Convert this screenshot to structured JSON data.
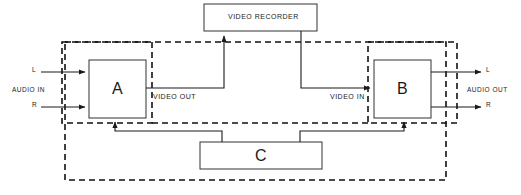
{
  "diagram": {
    "type": "block-diagram",
    "colors": {
      "line": "#1a1a1a",
      "dashed": "#111111",
      "background": "#ffffff",
      "text": "#1a1a1a"
    },
    "blocks": [
      {
        "id": "recorder",
        "label": "VIDEO RECORDER",
        "shape": "rectangle",
        "x": 204,
        "y": 4,
        "w": 113,
        "h": 27
      },
      {
        "id": "a",
        "label": "A",
        "shape": "rectangle",
        "x": 89,
        "y": 60,
        "w": 57,
        "h": 58
      },
      {
        "id": "b",
        "label": "B",
        "shape": "rectangle",
        "x": 374,
        "y": 60,
        "w": 57,
        "h": 58
      },
      {
        "id": "c",
        "label": "C",
        "shape": "rectangle",
        "x": 200,
        "y": 142,
        "w": 122,
        "h": 27
      }
    ],
    "enclosures": [
      {
        "id": "outer-dashed",
        "style": "dashed",
        "x": 65,
        "y": 42,
        "w": 381,
        "h": 138
      },
      {
        "id": "unit-a-dashed",
        "style": "dashed",
        "x": 62,
        "y": 42,
        "w": 90,
        "h": 81
      },
      {
        "id": "unit-b-dashed",
        "style": "dashed",
        "x": 368,
        "y": 42,
        "w": 89,
        "h": 81
      }
    ],
    "labels": {
      "audio_in": "AUDIO IN",
      "audio_out": "AUDIO OUT",
      "left_in": "L",
      "right_in": "R",
      "left_out": "L",
      "right_out": "R",
      "video_out": "VIDEO OUT",
      "video_in": "VIDEO IN",
      "recorder": "VIDEO RECORDER",
      "block_a": "A",
      "block_b": "B",
      "block_c": "C"
    },
    "connections": [
      {
        "id": "left-in-to-a",
        "from": "AUDIO IN L",
        "to": "A",
        "arrow": true
      },
      {
        "id": "right-in-to-a",
        "from": "AUDIO IN R",
        "to": "A",
        "arrow": true
      },
      {
        "id": "a-to-recorder",
        "from": "A VIDEO OUT",
        "to": "VIDEO RECORDER",
        "arrow": true
      },
      {
        "id": "recorder-to-b",
        "from": "VIDEO RECORDER",
        "to": "B VIDEO IN",
        "arrow": true
      },
      {
        "id": "c-to-a",
        "from": "C",
        "to": "A",
        "arrow": true
      },
      {
        "id": "c-to-b",
        "from": "C",
        "to": "B",
        "arrow": true
      },
      {
        "id": "b-to-left-out",
        "from": "B",
        "to": "AUDIO OUT L",
        "arrow": true
      },
      {
        "id": "b-to-right-out",
        "from": "B",
        "to": "AUDIO OUT R",
        "arrow": true
      }
    ]
  }
}
